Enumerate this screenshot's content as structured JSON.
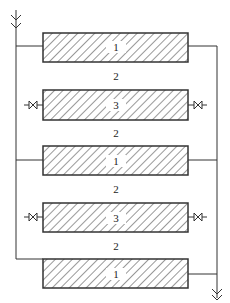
{
  "diagram": {
    "type": "parallel flow channel schematic",
    "colors": {
      "line": "#333333",
      "background": "#ffffff"
    },
    "components": [
      {
        "label": "1",
        "role": "hatched-block"
      },
      {
        "label": "2",
        "role": "gap-channel"
      },
      {
        "label": "3",
        "role": "hatched-block-with-valves"
      },
      {
        "label": "2",
        "role": "gap-channel"
      },
      {
        "label": "1",
        "role": "hatched-block"
      },
      {
        "label": "2",
        "role": "gap-channel"
      },
      {
        "label": "3",
        "role": "hatched-block-with-valves"
      },
      {
        "label": "2",
        "role": "gap-channel"
      },
      {
        "label": "1",
        "role": "hatched-block"
      }
    ],
    "icons": {
      "inlet": "double-chevron-down-icon",
      "outlet": "double-chevron-down-icon",
      "valve": "bowtie-valve-icon"
    }
  }
}
